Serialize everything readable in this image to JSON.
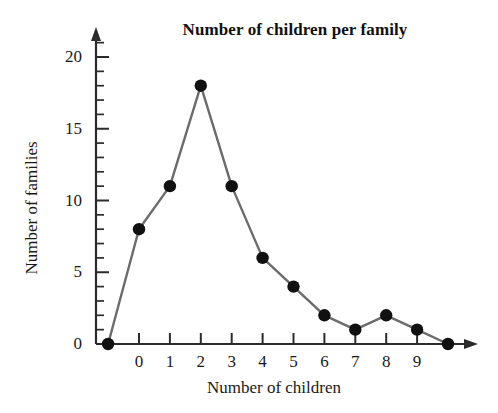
{
  "chart_data": {
    "type": "line",
    "title": "Number of children per family",
    "xlabel": "Number of children",
    "ylabel": "Number of families",
    "x": [
      -1,
      0,
      1,
      2,
      3,
      4,
      5,
      6,
      7,
      8,
      9,
      10
    ],
    "values": [
      0,
      8,
      11,
      18,
      11,
      6,
      4,
      2,
      1,
      2,
      1,
      0
    ],
    "categories": [
      "-1",
      "0",
      "1",
      "2",
      "3",
      "4",
      "5",
      "6",
      "7",
      "8",
      "9",
      "10"
    ],
    "x_tick_labels": [
      "0",
      "1",
      "2",
      "3",
      "4",
      "5",
      "6",
      "7",
      "8",
      "9"
    ],
    "x_tick_values": [
      0,
      1,
      2,
      3,
      4,
      5,
      6,
      7,
      8,
      9
    ],
    "y_tick_labels": [
      "0",
      "5",
      "10",
      "15",
      "20"
    ],
    "y_tick_values": [
      0,
      5,
      10,
      15,
      20
    ],
    "y_minor_tick_values": [
      1,
      2,
      3,
      4,
      6,
      7,
      8,
      9,
      11,
      12,
      13,
      14,
      16,
      17,
      18,
      19,
      21
    ],
    "xlim": [
      -1.6,
      11.2
    ],
    "ylim": [
      0,
      21.5
    ],
    "grid": false,
    "legend": null,
    "marker": "filled-circle",
    "marker_color": "#111111",
    "line_color": "#6b6b6b",
    "axis_color": "#2b2b2b",
    "background": "#ffffff",
    "points": [
      {
        "x": -1,
        "y": 0
      },
      {
        "x": 0,
        "y": 8
      },
      {
        "x": 1,
        "y": 11
      },
      {
        "x": 2,
        "y": 18
      },
      {
        "x": 3,
        "y": 11
      },
      {
        "x": 4,
        "y": 6
      },
      {
        "x": 5,
        "y": 4
      },
      {
        "x": 6,
        "y": 2
      },
      {
        "x": 7,
        "y": 1
      },
      {
        "x": 8,
        "y": 2
      },
      {
        "x": 9,
        "y": 1
      },
      {
        "x": 10,
        "y": 0
      }
    ]
  }
}
